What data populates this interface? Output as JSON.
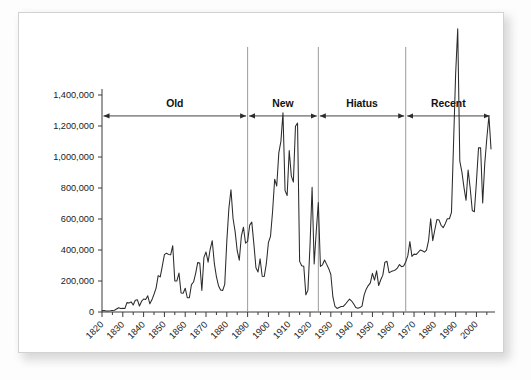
{
  "figure": {
    "background_color": "#ffffff",
    "border_color": "#d2d2d2",
    "line_color": "#2b2b2b",
    "axis_color": "#3a3a3a",
    "divider_color": "#8e8e8e"
  },
  "chart_data": {
    "type": "line",
    "title": "",
    "subtitle": "",
    "xlabel": "",
    "ylabel": "",
    "xlim": [
      1820,
      2007
    ],
    "ylim": [
      0,
      1400000
    ],
    "grid": false,
    "legend_position": "none",
    "y_ticks": [
      0,
      200000,
      400000,
      600000,
      800000,
      1000000,
      1200000,
      1400000
    ],
    "y_tick_labels": [
      "0",
      "200,000",
      "400,000",
      "600,000",
      "800,000",
      "1,000,000",
      "1,200,000",
      "1,400,000"
    ],
    "x_ticks": [
      1820,
      1830,
      1840,
      1850,
      1860,
      1870,
      1880,
      1890,
      1900,
      1910,
      1920,
      1930,
      1940,
      1950,
      1960,
      1970,
      1980,
      1990,
      2000
    ],
    "x_tick_labels": [
      "1820",
      "1830",
      "1840",
      "1850",
      "1860",
      "1870",
      "1880",
      "1890",
      "1900",
      "1910",
      "1920",
      "1930",
      "1940",
      "1950",
      "1960",
      "1970",
      "1980",
      "1990",
      "2000"
    ],
    "x_tick_rotation": -45,
    "x_minor_tick_interval": 5,
    "annotations": [
      {
        "label": "Old",
        "start_year": 1820,
        "end_year": 1890,
        "arrow": "double-headed"
      },
      {
        "label": "New",
        "start_year": 1890,
        "end_year": 1924,
        "arrow": "double-headed"
      },
      {
        "label": "Hiatus",
        "start_year": 1924,
        "end_year": 1966,
        "arrow": "double-headed"
      },
      {
        "label": "Recent",
        "start_year": 1966,
        "end_year": 2007,
        "arrow": "double-headed"
      }
    ],
    "divider_years": [
      1890,
      1924,
      1966
    ],
    "annotation_y_value": 1265000,
    "series": [
      {
        "name": "Immigration",
        "x": [
          1820,
          1821,
          1822,
          1823,
          1824,
          1825,
          1826,
          1827,
          1828,
          1829,
          1830,
          1831,
          1832,
          1833,
          1834,
          1835,
          1836,
          1837,
          1838,
          1839,
          1840,
          1841,
          1842,
          1843,
          1844,
          1845,
          1846,
          1847,
          1848,
          1849,
          1850,
          1851,
          1852,
          1853,
          1854,
          1855,
          1856,
          1857,
          1858,
          1859,
          1860,
          1861,
          1862,
          1863,
          1864,
          1865,
          1866,
          1867,
          1868,
          1869,
          1870,
          1871,
          1872,
          1873,
          1874,
          1875,
          1876,
          1877,
          1878,
          1879,
          1880,
          1881,
          1882,
          1883,
          1884,
          1885,
          1886,
          1887,
          1888,
          1889,
          1890,
          1891,
          1892,
          1893,
          1894,
          1895,
          1896,
          1897,
          1898,
          1899,
          1900,
          1901,
          1902,
          1903,
          1904,
          1905,
          1906,
          1907,
          1908,
          1909,
          1910,
          1911,
          1912,
          1913,
          1914,
          1915,
          1916,
          1917,
          1918,
          1919,
          1920,
          1921,
          1922,
          1923,
          1924,
          1925,
          1926,
          1927,
          1928,
          1929,
          1930,
          1931,
          1932,
          1933,
          1934,
          1935,
          1936,
          1937,
          1938,
          1939,
          1940,
          1941,
          1942,
          1943,
          1944,
          1945,
          1946,
          1947,
          1948,
          1949,
          1950,
          1951,
          1952,
          1953,
          1954,
          1955,
          1956,
          1957,
          1958,
          1959,
          1960,
          1961,
          1962,
          1963,
          1964,
          1965,
          1966,
          1967,
          1968,
          1969,
          1970,
          1971,
          1972,
          1973,
          1974,
          1975,
          1976,
          1977,
          1978,
          1979,
          1980,
          1981,
          1982,
          1983,
          1984,
          1985,
          1986,
          1987,
          1988,
          1989,
          1990,
          1991,
          1992,
          1993,
          1994,
          1995,
          1996,
          1997,
          1998,
          1999,
          2000,
          2001,
          2002,
          2003,
          2004,
          2005,
          2006,
          2007
        ],
        "values": [
          8385,
          9127,
          6911,
          6354,
          7912,
          10199,
          10837,
          18875,
          27382,
          22520,
          23322,
          22633,
          60482,
          58640,
          65365,
          45374,
          76242,
          79340,
          38914,
          68069,
          84066,
          80289,
          104565,
          52496,
          78615,
          114371,
          154416,
          234968,
          226527,
          297024,
          369980,
          379466,
          371603,
          368645,
          427833,
          200877,
          200436,
          251306,
          123126,
          121282,
          153640,
          91918,
          91985,
          176282,
          193418,
          248120,
          318568,
          315722,
          138840,
          352768,
          387203,
          321350,
          404806,
          459803,
          313339,
          227498,
          169986,
          141857,
          138469,
          177826,
          457257,
          669431,
          788992,
          603322,
          518592,
          395346,
          334203,
          490109,
          546889,
          444427,
          455302,
          560319,
          579663,
          439730,
          285631,
          258536,
          343267,
          230832,
          229299,
          311715,
          448572,
          487918,
          648743,
          857046,
          812870,
          1026499,
          1100735,
          1285349,
          782870,
          751786,
          1041570,
          878587,
          838172,
          1197892,
          1218480,
          326700,
          298826,
          295403,
          110618,
          141132,
          430001,
          805228,
          309556,
          522919,
          706896,
          294314,
          304488,
          335175,
          307255,
          279678,
          241700,
          97139,
          35576,
          23068,
          29470,
          34956,
          36329,
          50244,
          67895,
          82998,
          70756,
          51776,
          28781,
          23725,
          28551,
          38119,
          108721,
          147292,
          170570,
          188317,
          249187,
          205717,
          265520,
          170434,
          208177,
          237790,
          321625,
          326867,
          253265,
          260686,
          265398,
          271344,
          283763,
          306260,
          292248,
          296697,
          323040,
          361972,
          454448,
          358579,
          373326,
          370478,
          384685,
          400063,
          394861,
          386194,
          398613,
          462315,
          601442,
          460348,
          530639,
          596600,
          594131,
          559763,
          543903,
          570009,
          601708,
          601516,
          643025,
          1090924,
          1536483,
          1827167,
          973977,
          904292,
          804416,
          720461,
          915900,
          798378,
          654451,
          646568,
          841002,
          1058902,
          1059356,
          703542,
          957883,
          1122373,
          1266264,
          1052415
        ]
      }
    ]
  },
  "y_axis": {
    "labels": [
      "1,400,000",
      "1,200,000",
      "1,000,000",
      "800,000",
      "600,000",
      "400,000",
      "200,000",
      "0"
    ]
  },
  "x_axis": {
    "labels": [
      "1820",
      "1830",
      "1840",
      "1850",
      "1860",
      "1870",
      "1880",
      "1890",
      "1900",
      "1910",
      "1920",
      "1930",
      "1940",
      "1950",
      "1960",
      "1970",
      "1980",
      "1990",
      "2000"
    ]
  },
  "periods": [
    {
      "label": "Old"
    },
    {
      "label": "New"
    },
    {
      "label": "Hiatus"
    },
    {
      "label": "Recent"
    }
  ]
}
